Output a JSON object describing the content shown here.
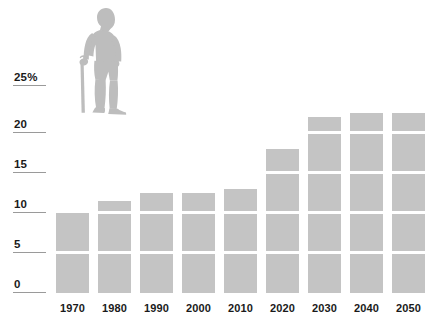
{
  "chart_data": {
    "type": "bar",
    "title": "",
    "subtitle": "",
    "xlabel": "",
    "ylabel": "",
    "categories": [
      "1970",
      "1980",
      "1990",
      "2000",
      "2010",
      "2020",
      "2030",
      "2040",
      "2050"
    ],
    "values": [
      10.0,
      11.5,
      12.5,
      12.5,
      13.0,
      18.0,
      22.0,
      22.5,
      22.5
    ],
    "ylim": [
      0,
      25
    ],
    "y_ticks": [
      "0",
      "5",
      "10",
      "15",
      "20",
      "25%"
    ],
    "y_tick_values": [
      0,
      5,
      10,
      15,
      20,
      25
    ],
    "grid": true,
    "grid_interval": 5,
    "legend": null,
    "legend_position": "none",
    "bar_color": "#c4c4c4",
    "gridline_color": "#ffffff",
    "axis_rule_color": "#9a9a9a",
    "text_color": "#1a1a1a",
    "annotations": []
  },
  "illustration": {
    "name": "elderly-person-with-cane",
    "color": "#bdbdbd"
  }
}
